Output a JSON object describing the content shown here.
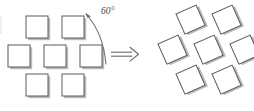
{
  "figure": {
    "background_color": "#ffffff",
    "width": 254,
    "height": 111,
    "stroke_color": "#5a5a5a",
    "shadow_color": "#9a9a9a",
    "fill_color": "#ffffff",
    "label_color": "#4a4a4a"
  },
  "annotations": {
    "angle_label": "60°",
    "angle_value": 60,
    "angle_unit": "degrees",
    "arrow_symbol": "double-right-arrow"
  },
  "left_group": {
    "name": "unrotated-square-lattice",
    "rotation_deg": 0,
    "square_size": 22,
    "rows": [
      {
        "count": 2,
        "y": 16,
        "xs": [
          26,
          62
        ]
      },
      {
        "count": 3,
        "y": 45,
        "xs": [
          8,
          44,
          80
        ]
      },
      {
        "count": 2,
        "y": 74,
        "xs": [
          26,
          62
        ]
      }
    ]
  },
  "right_group": {
    "name": "rotated-square-lattice",
    "rotation_deg": -24,
    "square_size": 22,
    "rows": [
      {
        "count": 2,
        "y": 14,
        "xs": [
          176,
          212
        ]
      },
      {
        "count": 3,
        "y": 44,
        "xs": [
          158,
          194,
          230
        ]
      },
      {
        "count": 2,
        "y": 74,
        "xs": [
          176,
          212
        ]
      }
    ]
  },
  "rotation_arc": {
    "name": "curved-rotation-arrow",
    "from": [
      84,
      13
    ],
    "to": [
      105,
      62
    ],
    "arrowhead_at": "start"
  }
}
